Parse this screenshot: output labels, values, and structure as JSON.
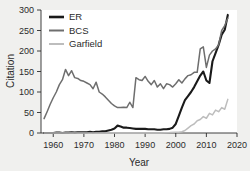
{
  "chart_data": {
    "type": "line",
    "title": "",
    "xlabel": "Year",
    "ylabel": "Citation",
    "xlim": [
      1956,
      2020
    ],
    "ylim": [
      0,
      300
    ],
    "xticks": [
      1960,
      1970,
      1980,
      1990,
      2000,
      2010,
      2020
    ],
    "yticks": [
      0,
      50,
      100,
      150,
      200,
      250,
      300
    ],
    "grid": false,
    "legend_position": "top-left",
    "background_color": "#f0f0ee",
    "plot_background_color": "#ffffff",
    "axis_color": "#2b2b2b",
    "series": [
      {
        "name": "ER",
        "color": "#1a1a1a",
        "width": 2.1,
        "x": [
          1957,
          1958,
          1959,
          1960,
          1961,
          1962,
          1963,
          1964,
          1965,
          1966,
          1967,
          1968,
          1969,
          1970,
          1971,
          1972,
          1973,
          1974,
          1975,
          1976,
          1977,
          1978,
          1979,
          1980,
          1981,
          1982,
          1983,
          1984,
          1985,
          1986,
          1987,
          1988,
          1989,
          1990,
          1991,
          1992,
          1993,
          1994,
          1995,
          1996,
          1997,
          1998,
          1999,
          2000,
          2001,
          2002,
          2003,
          2004,
          2005,
          2006,
          2007,
          2008,
          2009,
          2010,
          2011,
          2012,
          2013,
          2014,
          2015,
          2016,
          2017
        ],
        "values": [
          0,
          0,
          0,
          0,
          1,
          1,
          0,
          1,
          1,
          2,
          1,
          2,
          2,
          2,
          2,
          3,
          2,
          3,
          3,
          4,
          4,
          6,
          8,
          11,
          18,
          16,
          13,
          13,
          12,
          11,
          10,
          10,
          10,
          10,
          9,
          9,
          9,
          8,
          8,
          9,
          9,
          10,
          13,
          22,
          42,
          62,
          80,
          90,
          100,
          112,
          126,
          140,
          150,
          128,
          122,
          175,
          195,
          215,
          240,
          252,
          288
        ]
      },
      {
        "name": "BCS",
        "color": "#6e6e6e",
        "width": 1.5,
        "x": [
          1957,
          1958,
          1959,
          1960,
          1961,
          1962,
          1963,
          1964,
          1965,
          1966,
          1967,
          1968,
          1969,
          1970,
          1971,
          1972,
          1973,
          1974,
          1975,
          1976,
          1977,
          1978,
          1979,
          1980,
          1981,
          1982,
          1983,
          1984,
          1985,
          1986,
          1987,
          1988,
          1989,
          1990,
          1991,
          1992,
          1993,
          1994,
          1995,
          1996,
          1997,
          1998,
          1999,
          2000,
          2001,
          2002,
          2003,
          2004,
          2005,
          2006,
          2007,
          2008,
          2009,
          2010,
          2011,
          2012,
          2013,
          2014,
          2015,
          2016,
          2017
        ],
        "values": [
          35,
          52,
          70,
          86,
          100,
          118,
          130,
          155,
          140,
          152,
          135,
          133,
          128,
          126,
          122,
          118,
          108,
          124,
          100,
          95,
          88,
          80,
          72,
          66,
          62,
          62,
          63,
          62,
          75,
          62,
          135,
          130,
          128,
          138,
          126,
          118,
          128,
          112,
          120,
          108,
          120,
          118,
          112,
          120,
          130,
          122,
          132,
          140,
          142,
          148,
          148,
          205,
          210,
          160,
          190,
          200,
          205,
          215,
          250,
          262,
          280
        ]
      },
      {
        "name": "Garfield",
        "color": "#bdbdbd",
        "width": 1.5,
        "x": [
          1957,
          1960,
          1965,
          1970,
          1975,
          1980,
          1985,
          1990,
          1995,
          1998,
          2000,
          2001,
          2002,
          2003,
          2004,
          2005,
          2006,
          2007,
          2008,
          2009,
          2010,
          2011,
          2012,
          2013,
          2014,
          2015,
          2016,
          2017
        ],
        "values": [
          0,
          0,
          0,
          0,
          0,
          0,
          0,
          0,
          0,
          1,
          2,
          2,
          3,
          6,
          12,
          18,
          22,
          30,
          33,
          40,
          36,
          48,
          44,
          56,
          52,
          62,
          58,
          82
        ]
      }
    ]
  }
}
